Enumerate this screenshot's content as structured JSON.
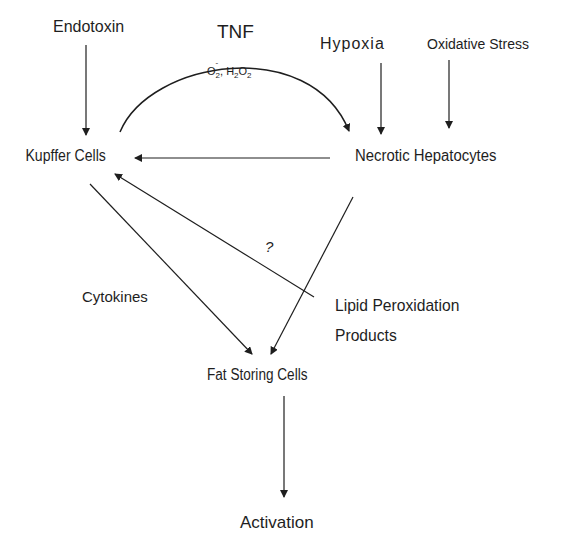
{
  "diagram": {
    "nodes": {
      "endotoxin": "Endotoxin",
      "tnf": "TNF",
      "ros": {
        "o2": "O",
        "o2_sub": "2",
        "o2_sup": "-",
        "sep": ", H",
        "h_sub": "2",
        "o": "O",
        "o_sub": "2"
      },
      "hypoxia": "Hypoxia",
      "oxidative_stress": "Oxidative Stress",
      "kupffer_cells": "Kupffer Cells",
      "necrotic_hepatocytes": "Necrotic Hepatocytes",
      "question_mark": "?",
      "cytokines": "Cytokines",
      "lipid_peroxidation_line1": "Lipid Peroxidation",
      "lipid_peroxidation_line2": "Products",
      "fat_storing_cells": "Fat Storing Cells",
      "activation": "Activation"
    },
    "edges": [
      {
        "from": "Endotoxin",
        "to": "Kupffer Cells"
      },
      {
        "from": "Kupffer Cells",
        "to": "Necrotic Hepatocytes",
        "label": "TNF / O2-, H2O2",
        "shape": "arc"
      },
      {
        "from": "Hypoxia",
        "to": "Necrotic Hepatocytes"
      },
      {
        "from": "Oxidative Stress",
        "to": "Necrotic Hepatocytes"
      },
      {
        "from": "Necrotic Hepatocytes",
        "to": "Kupffer Cells"
      },
      {
        "from": "Lipid Peroxidation Products",
        "to": "Kupffer Cells",
        "label": "?"
      },
      {
        "from": "Kupffer Cells",
        "to": "Fat Storing Cells",
        "label": "Cytokines"
      },
      {
        "from": "Necrotic Hepatocytes",
        "to": "Fat Storing Cells"
      },
      {
        "from": "Fat Storing Cells",
        "to": "Activation"
      }
    ],
    "colors": {
      "line": "#1e1e1e",
      "background": "#ffffff"
    }
  }
}
